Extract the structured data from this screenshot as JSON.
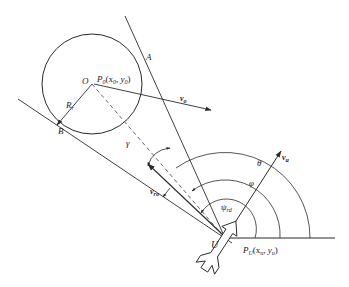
{
  "figure": {
    "type": "geometric-diagram",
    "colors": {
      "stroke": "#2a2a2a",
      "background": "#ffffff",
      "dashed": "#555555"
    }
  },
  "labels": {
    "tangent_point_A": "A",
    "tangent_point_B": "B",
    "obstacle_center": "O",
    "obstacle_position_P": "P",
    "obstacle_position_sub": "0",
    "obstacle_position_coords": "(x",
    "obstacle_x_sub": "0",
    "obstacle_y": ",  y",
    "obstacle_y_sub": "0",
    "obstacle_close": ")",
    "radius_R": "R",
    "radius_sub": "r",
    "obstacle_velocity": "v",
    "obstacle_velocity_sub": "o",
    "relative_velocity": "v",
    "relative_velocity_sub": "ro",
    "uav_velocity": "v",
    "uav_velocity_sub": "u",
    "angle_gamma": "γ",
    "angle_theta": "θ",
    "angle_phi": "φ",
    "angle_psi": "ψ",
    "angle_psi_sub": "rd",
    "uav": "U",
    "uav_position_P": "P",
    "uav_position_sub": "U",
    "uav_position_coords": "(x",
    "uav_x_sub": "u",
    "uav_y": ",  y",
    "uav_y_sub": "u",
    "uav_close": ")"
  }
}
